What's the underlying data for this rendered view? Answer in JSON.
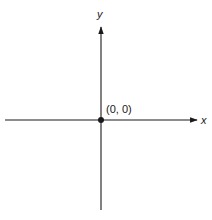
{
  "diagram": {
    "x_axis_label": "x",
    "y_axis_label": "y",
    "origin_label": "(0, 0)",
    "colors": {
      "ink": "#1a1a1a",
      "background": "#ffffff"
    }
  }
}
